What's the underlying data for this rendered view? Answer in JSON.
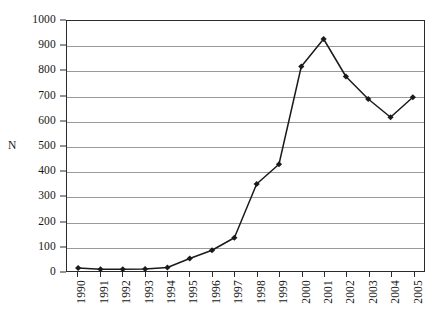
{
  "chart_data": {
    "type": "line",
    "title": "",
    "subtitle": "",
    "xlabel": "",
    "ylabel": "N",
    "categories": [
      "1990",
      "1991",
      "1992",
      "1993",
      "1994",
      "1995",
      "1996",
      "1997",
      "1998",
      "1999",
      "2000",
      "2001",
      "2002",
      "2003",
      "2004",
      "2005"
    ],
    "values": [
      12,
      7,
      7,
      8,
      14,
      50,
      83,
      133,
      348,
      427,
      818,
      928,
      778,
      688,
      615,
      695
    ],
    "series": [
      {
        "name": "N",
        "values": [
          12,
          7,
          7,
          8,
          14,
          50,
          83,
          133,
          348,
          427,
          818,
          928,
          778,
          688,
          615,
          695
        ]
      }
    ],
    "ylim": [
      0,
      1000
    ],
    "y_ticks": [
      0,
      100,
      200,
      300,
      400,
      500,
      600,
      700,
      800,
      900,
      1000
    ],
    "y_tick_labels": [
      "0",
      "100",
      "200",
      "300",
      "400",
      "500",
      "600",
      "700",
      "800",
      "900",
      "1000"
    ],
    "grid": true,
    "grid_axis": "y",
    "legend": false,
    "legend_position": "none",
    "marker": "diamond",
    "line_color": "#1a1a1a",
    "marker_color": "#1a1a1a",
    "grid_color": "#9a9a9a",
    "frame_color": "#2b2b2b",
    "background_color": "#ffffff",
    "x_tick_label_rotation": 90,
    "annotations": []
  }
}
